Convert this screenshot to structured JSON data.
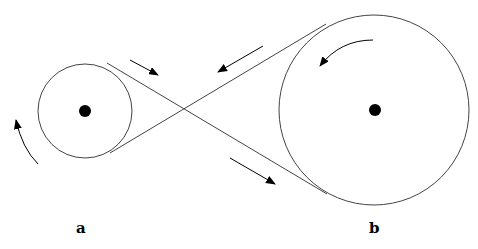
{
  "labels": {
    "a": "a",
    "b": "b"
  },
  "pulleys": [
    {
      "name": "a",
      "cx": 85,
      "cy": 111,
      "r": 47
    },
    {
      "name": "b",
      "cx": 374,
      "cy": 110,
      "r": 95
    }
  ],
  "colors": {
    "stroke": "#333333",
    "fill": "#000000"
  }
}
